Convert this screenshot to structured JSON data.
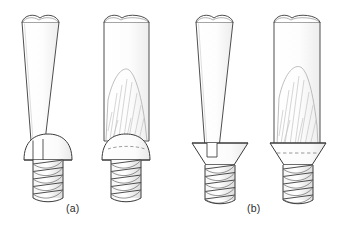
{
  "figure": {
    "domain": "technical-line-drawing",
    "background_color": "#ffffff",
    "line_color": "#3a3a3a",
    "light_line_color": "#9a9a9a",
    "flow_line_color": "#b0b0b0",
    "dashed_line_color": "#8d8d8d",
    "fill_color": "#ffffff",
    "shade_color": "#f2f2f2",
    "width": 343,
    "height": 230
  },
  "captions": [
    {
      "id": "a",
      "label": "(a)",
      "x": 66,
      "y": 202,
      "describes": "round head screw with slotted drive"
    },
    {
      "id": "b",
      "label": "(b)",
      "x": 247,
      "y": 202,
      "describes": "countersunk flat head screw with slotted drive"
    }
  ],
  "panels": [
    {
      "id": "panel-a",
      "caption": "(a)",
      "screw_head_type": "round-head",
      "items": [
        {
          "id": "a-left",
          "name": "tapered-blade-over-round-head-screw",
          "blade_type": "tapered",
          "blade_has_flow_lines": false,
          "screw_head": "round-head",
          "slot_visible": true,
          "dashed_hidden_line": false,
          "thread_turns": 5
        },
        {
          "id": "a-right",
          "name": "parallel-blade-in-round-head-screw",
          "blade_type": "parallel",
          "blade_has_flow_lines": true,
          "screw_head": "round-head",
          "slot_visible": false,
          "dashed_hidden_line": true,
          "thread_turns": 5
        }
      ]
    },
    {
      "id": "panel-b",
      "caption": "(b)",
      "screw_head_type": "countersunk-head",
      "items": [
        {
          "id": "b-left",
          "name": "tapered-blade-over-countersunk-head-screw",
          "blade_type": "tapered",
          "blade_has_flow_lines": false,
          "screw_head": "countersunk-head",
          "slot_visible": true,
          "dashed_hidden_line": false,
          "thread_turns": 5
        },
        {
          "id": "b-right",
          "name": "parallel-blade-in-countersunk-head-screw",
          "blade_type": "parallel",
          "blade_has_flow_lines": true,
          "screw_head": "countersunk-head",
          "slot_visible": false,
          "dashed_hidden_line": true,
          "thread_turns": 5
        }
      ]
    }
  ]
}
